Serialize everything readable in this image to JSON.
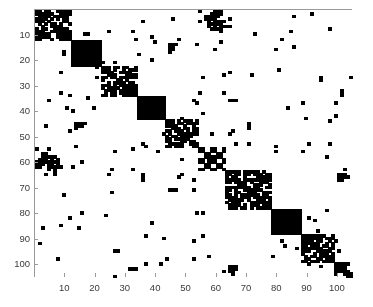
{
  "figure": {
    "type": "spy-plot",
    "background_color": "#ffffff",
    "axis_color": "#9a9a9a",
    "marker_color": "#000000",
    "tick_label_color": "#3a3a3a"
  },
  "chart_data": {
    "type": "heatmap",
    "title": "",
    "subtitle": "",
    "xlabel": "",
    "ylabel": "",
    "grid": false,
    "legend": "none",
    "matrix_size": 105,
    "xlim": [
      0,
      105
    ],
    "ylim": [
      105,
      0
    ],
    "xticks": [
      10,
      20,
      30,
      40,
      50,
      60,
      70,
      80,
      90,
      100
    ],
    "yticks": [
      10,
      20,
      30,
      40,
      50,
      60,
      70,
      80,
      90,
      100
    ],
    "xticklabels": [
      "10",
      "20",
      "30",
      "40",
      "50",
      "60",
      "70",
      "80",
      "90",
      "100"
    ],
    "yticklabels": [
      "10",
      "20",
      "30",
      "40",
      "50",
      "60",
      "70",
      "80",
      "90",
      "100"
    ],
    "marker_color": "#000000",
    "background_color": "#ffffff",
    "blocks": [
      {
        "index": 1,
        "start": 1,
        "end": 12,
        "density": 0.62,
        "style": "textured"
      },
      {
        "index": 2,
        "start": 13,
        "end": 22,
        "density": 1.0,
        "style": "solid"
      },
      {
        "index": 3,
        "start": 23,
        "end": 34,
        "density": 0.64,
        "style": "textured"
      },
      {
        "index": 4,
        "start": 35,
        "end": 43,
        "density": 1.0,
        "style": "solid"
      },
      {
        "index": 5,
        "start": 44,
        "end": 54,
        "density": 0.63,
        "style": "textured"
      },
      {
        "index": 6,
        "start": 55,
        "end": 63,
        "density": 0.45,
        "style": "coarse"
      },
      {
        "index": 7,
        "start": 64,
        "end": 78,
        "density": 0.6,
        "style": "textured"
      },
      {
        "index": 8,
        "start": 79,
        "end": 88,
        "density": 1.0,
        "style": "solid"
      },
      {
        "index": 9,
        "start": 89,
        "end": 99,
        "density": 0.62,
        "style": "textured"
      },
      {
        "index": 10,
        "start": 100,
        "end": 105,
        "density": 0.55,
        "style": "textured"
      }
    ],
    "offdiagonal_noise_density": 0.012,
    "nonzero_estimate": 3150
  }
}
